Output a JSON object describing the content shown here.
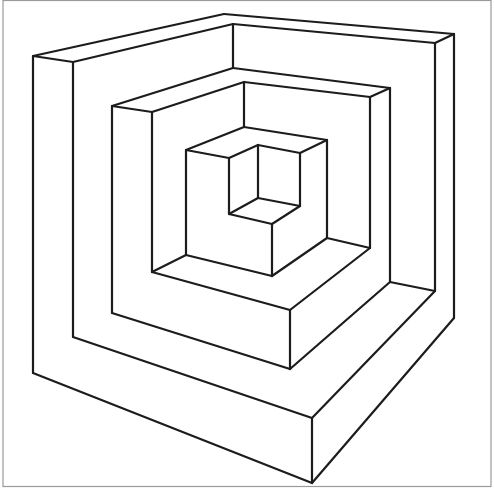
{
  "figure": {
    "title": "",
    "colors": {
      "background": "#ffffff",
      "ink": "#1c1c1c",
      "border": "#9a9a9a"
    },
    "tiers": [
      {
        "name": "outer",
        "lines": [
          [
            224,
            14,
            454,
            34
          ],
          [
            224,
            14,
            33,
            56
          ],
          [
            233,
            24,
            435,
            43
          ],
          [
            233,
            24,
            73,
            62
          ],
          [
            33,
            56,
            73,
            62
          ],
          [
            435,
            43,
            454,
            34
          ],
          [
            33,
            56,
            33,
            373
          ],
          [
            73,
            62,
            73,
            337
          ],
          [
            435,
            43,
            435,
            291
          ],
          [
            454,
            34,
            454,
            318
          ],
          [
            233,
            24,
            233,
            68
          ],
          [
            33,
            373,
            312,
            483
          ],
          [
            312,
            483,
            454,
            318
          ],
          [
            312,
            418,
            312,
            483
          ],
          [
            73,
            337,
            312,
            418
          ],
          [
            312,
            418,
            435,
            291
          ]
        ]
      },
      {
        "name": "middle",
        "lines": [
          [
            233,
            68,
            112,
            106
          ],
          [
            233,
            68,
            390,
            88
          ],
          [
            244,
            82,
            152,
            112
          ],
          [
            244,
            82,
            370,
            97
          ],
          [
            112,
            106,
            152,
            112
          ],
          [
            370,
            97,
            390,
            88
          ],
          [
            112,
            106,
            112,
            313
          ],
          [
            152,
            112,
            152,
            272
          ],
          [
            390,
            88,
            390,
            282
          ],
          [
            370,
            97,
            370,
            248
          ],
          [
            244,
            82,
            244,
            127
          ],
          [
            112,
            313,
            290,
            369
          ],
          [
            290,
            369,
            390,
            282
          ],
          [
            290,
            310,
            290,
            369
          ],
          [
            152,
            272,
            290,
            310
          ],
          [
            290,
            310,
            370,
            248
          ],
          [
            390,
            282,
            435,
            291
          ]
        ]
      },
      {
        "name": "inner",
        "lines": [
          [
            244,
            127,
            186,
            150
          ],
          [
            244,
            127,
            327,
            140
          ],
          [
            186,
            150,
            229,
            158
          ],
          [
            229,
            158,
            258,
            145
          ],
          [
            258,
            145,
            300,
            153
          ],
          [
            300,
            153,
            327,
            140
          ],
          [
            186,
            150,
            186,
            255
          ],
          [
            327,
            140,
            327,
            238
          ],
          [
            229,
            158,
            229,
            214
          ],
          [
            258,
            145,
            258,
            198
          ],
          [
            300,
            153,
            300,
            206
          ],
          [
            229,
            214,
            258,
            198
          ],
          [
            258,
            198,
            300,
            206
          ],
          [
            229,
            214,
            272,
            224
          ],
          [
            272,
            224,
            300,
            206
          ],
          [
            272,
            224,
            272,
            276
          ],
          [
            186,
            255,
            272,
            276
          ],
          [
            272,
            276,
            327,
            238
          ],
          [
            327,
            238,
            370,
            248
          ],
          [
            186,
            255,
            152,
            272
          ]
        ]
      }
    ]
  }
}
